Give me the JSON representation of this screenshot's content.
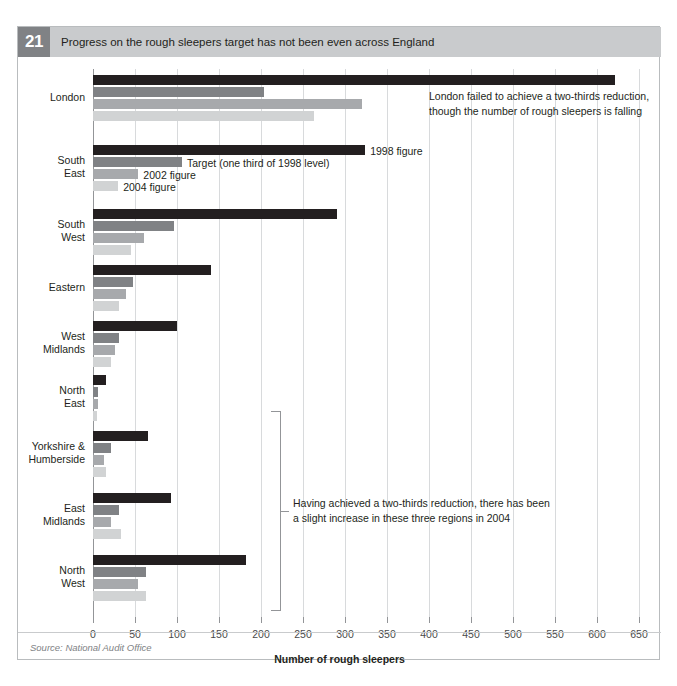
{
  "figure": {
    "number": "21",
    "title": "Progress on the rough sleepers target has not been even across England",
    "source": "Source: National Audit Office"
  },
  "annotations": {
    "london": "London failed to achieve a two-thirds reduction,\nthough the number of rough sleepers is falling",
    "three_regions": "Having achieved a two-thirds reduction, there has been\na slight increase in these three regions in 2004",
    "tag_1998": "1998 figure",
    "tag_target": "Target (one third of 1998 level)",
    "tag_2002": "2002 figure",
    "tag_2004": "2004 figure"
  },
  "colors": {
    "s1998": "#231f20",
    "target": "#808285",
    "s2002": "#a7a9ac",
    "s2004": "#d1d3d4",
    "title_band": "#c9cbcd",
    "number_box": "#808285",
    "gridline": "#d8dadc",
    "axis": "#939598"
  },
  "chart_data": {
    "type": "bar",
    "orientation": "horizontal",
    "title": "Progress on the rough sleepers target has not been even across England",
    "xlabel": "Number of rough sleepers",
    "ylabel": "",
    "xlim": [
      0,
      650
    ],
    "xticks": [
      0,
      50,
      100,
      150,
      200,
      250,
      300,
      350,
      400,
      450,
      500,
      550,
      600,
      650
    ],
    "xtick_labels": [
      "0",
      "50",
      "100",
      "150",
      "200",
      "250",
      "300",
      "350",
      "400",
      "450",
      "500",
      "550",
      "600",
      "650"
    ],
    "grid": "vertical",
    "legend": "inline-labels",
    "categories": [
      "London",
      "South East",
      "South West",
      "Eastern",
      "West Midlands",
      "North East",
      "Yorkshire & Humberside",
      "East Midlands",
      "North West"
    ],
    "series": [
      {
        "name": "1998 figure",
        "color": "#231f20",
        "values": [
          621,
          324,
          290,
          140,
          100,
          15,
          66,
          93,
          182
        ]
      },
      {
        "name": "Target (one third of 1998 level)",
        "color": "#808285",
        "values": [
          204,
          106,
          97,
          48,
          31,
          6,
          21,
          31,
          63
        ]
      },
      {
        "name": "2002 figure",
        "color": "#a7a9ac",
        "values": [
          320,
          54,
          61,
          39,
          26,
          6,
          13,
          21,
          54
        ]
      },
      {
        "name": "2004 figure",
        "color": "#d1d3d4",
        "values": [
          263,
          30,
          45,
          31,
          22,
          5,
          16,
          33,
          63
        ]
      }
    ]
  }
}
